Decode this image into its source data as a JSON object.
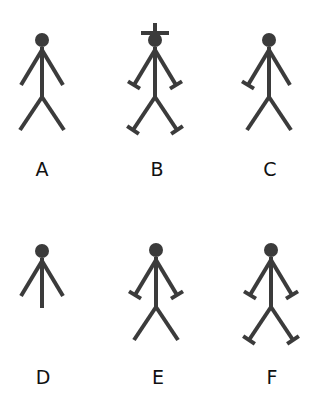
{
  "style": {
    "stroke": "#3b3b3b",
    "label_color": "#111111",
    "background": "#ffffff"
  },
  "figures": [
    {
      "label": "A",
      "cx": 42,
      "headY": 40,
      "hat": false,
      "leftHand": false,
      "rightHand": false,
      "legs": true,
      "leftFoot": false,
      "rightFoot": false,
      "labelY": 158
    },
    {
      "label": "B",
      "cx": 155,
      "headY": 40,
      "hat": true,
      "leftHand": true,
      "rightHand": true,
      "legs": true,
      "leftFoot": true,
      "rightFoot": true,
      "labelY": 158
    },
    {
      "label": "C",
      "cx": 269,
      "headY": 40,
      "hat": false,
      "leftHand": true,
      "rightHand": false,
      "legs": true,
      "leftFoot": false,
      "rightFoot": false,
      "labelY": 158
    },
    {
      "label": "D",
      "cx": 42,
      "headY": 251,
      "hat": false,
      "leftHand": false,
      "rightHand": false,
      "legs": false,
      "leftFoot": false,
      "rightFoot": false,
      "labelY": 366
    },
    {
      "label": "E",
      "cx": 156,
      "headY": 250,
      "hat": false,
      "leftHand": true,
      "rightHand": true,
      "legs": true,
      "leftFoot": false,
      "rightFoot": false,
      "labelY": 366
    },
    {
      "label": "F",
      "cx": 271,
      "headY": 250,
      "hat": false,
      "leftHand": true,
      "rightHand": true,
      "legs": true,
      "leftFoot": true,
      "rightFoot": true,
      "labelY": 366
    }
  ]
}
